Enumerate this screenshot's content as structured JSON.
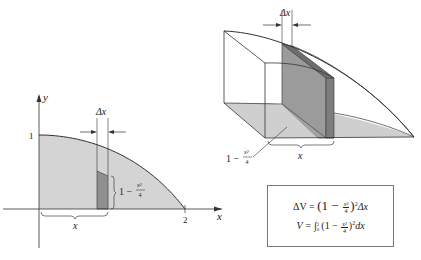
{
  "figure_2d": {
    "y_axis_label": "y",
    "x_axis_label": "x",
    "y_tick_1": "1",
    "x_tick_2": "2",
    "delta_label": "Δx",
    "height_label_prefix": "1 −",
    "height_frac_num": "x²",
    "height_frac_den": "4",
    "base_label": "x",
    "colors": {
      "region": "#d4d4d4",
      "strip": "#8f8f8f",
      "curve": "#333333"
    }
  },
  "figure_3d": {
    "delta_label": "Δx",
    "height_label_prefix": "1 −",
    "height_frac_num": "x²",
    "height_frac_den": "4",
    "base_label": "x",
    "colors": {
      "floor": "#cfcfcf",
      "slab": "#9b9b9b",
      "slab_edge": "#7d7d7d"
    }
  },
  "formula_box": {
    "line1": {
      "lhs": "ΔV = ",
      "open": "(1 − ",
      "frac_num": "x²",
      "frac_den": "4",
      "close": ")",
      "exp": "2",
      "tail": "Δx"
    },
    "line2": {
      "lhs": "V = ",
      "integral": "∫",
      "upper": "2",
      "lower": "0",
      "open": "(1 − ",
      "frac_num": "x²",
      "frac_den": "4",
      "close": ")",
      "exp": "2",
      "tail": "dx"
    }
  }
}
